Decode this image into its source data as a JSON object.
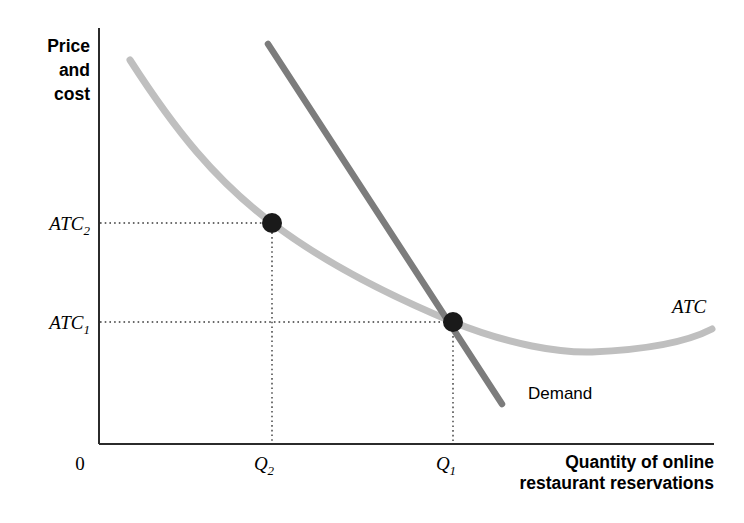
{
  "chart_data": {
    "type": "line",
    "title": "",
    "subtitle": "",
    "ylabel_lines": [
      "Price",
      "and",
      "cost"
    ],
    "xlabel_lines": [
      "Quantity of online",
      "restaurant reservations"
    ],
    "origin_label": "0",
    "grid": false,
    "legend_position": "inline-annotations",
    "axis": {
      "x_range_label": "Quantity of online restaurant reservations",
      "y_range_label": "Price and cost",
      "x_tick_labels": [
        "Q",
        "Q"
      ],
      "x_tick_label_full": [
        "Q2",
        "Q1"
      ],
      "y_tick_label_full": [
        "ATC2",
        "ATC1"
      ]
    },
    "y_ticks": [
      {
        "base": "ATC",
        "sub": "2",
        "value_note": "higher average total cost",
        "pixel_y": 223
      },
      {
        "base": "ATC",
        "sub": "1",
        "value_note": "lower average total cost",
        "pixel_y": 322
      }
    ],
    "x_ticks": [
      {
        "base": "Q",
        "sub": "2",
        "value_note": "smaller quantity",
        "pixel_x": 272
      },
      {
        "base": "Q",
        "sub": "1",
        "value_note": "larger quantity",
        "pixel_x": 453
      }
    ],
    "series": [
      {
        "name": "ATC",
        "label": "ATC",
        "type": "curve",
        "color": "#bfbfbf",
        "description": "U-shaped average total cost curve, downward sloping then rising",
        "path": "M 130 60 C 175 130, 215 180, 272 223 C 330 267, 400 300, 453 322 C 510 345, 560 353, 592 352 C 640 350, 685 343, 712 329",
        "label_x": 672,
        "label_y": 313
      },
      {
        "name": "Demand",
        "label": "Demand",
        "type": "line",
        "color": "#7c7c7c",
        "description": "Downward sloping demand curve crossing ATC at Q1",
        "path": "M 268 44 L 502 404",
        "label_x": 528,
        "label_y": 399
      }
    ],
    "points": [
      {
        "name": "point-q2",
        "x_label": "Q2",
        "y_label": "ATC2",
        "pixel_x": 272,
        "pixel_y": 223,
        "radius": 10,
        "color": "#1a1a1a",
        "note": "ATC at smaller quantity"
      },
      {
        "name": "point-q1",
        "x_label": "Q1",
        "y_label": "ATC1",
        "pixel_x": 453,
        "pixel_y": 322,
        "radius": 10,
        "color": "#1a1a1a",
        "note": "equilibrium where demand meets ATC"
      }
    ],
    "guides": [
      {
        "name": "guide-h-atc2",
        "type": "horizontal",
        "from": [
          100,
          223
        ],
        "to": [
          272,
          223
        ]
      },
      {
        "name": "guide-v-q2",
        "type": "vertical",
        "from": [
          272,
          223
        ],
        "to": [
          272,
          444
        ]
      },
      {
        "name": "guide-h-atc1",
        "type": "horizontal",
        "from": [
          100,
          322
        ],
        "to": [
          453,
          322
        ]
      },
      {
        "name": "guide-v-q1",
        "type": "vertical",
        "from": [
          453,
          322
        ],
        "to": [
          453,
          444
        ]
      }
    ],
    "colors": {
      "atc_curve": "#bfbfbf",
      "demand_line": "#7c7c7c",
      "axis": "#2b2b2b",
      "marker": "#1a1a1a",
      "guide": "#3a3a3a",
      "background": "#ffffff"
    }
  },
  "labels": {
    "y_axis_line1": "Price",
    "y_axis_line2": "and",
    "y_axis_line3": "cost",
    "x_axis_line1": "Quantity of online",
    "x_axis_line2": "restaurant reservations",
    "origin": "0",
    "atc2_base": "ATC",
    "atc2_sub": "2",
    "atc1_base": "ATC",
    "atc1_sub": "1",
    "q2_base": "Q",
    "q2_sub": "2",
    "q1_base": "Q",
    "q1_sub": "1",
    "atc_curve": "ATC",
    "demand_curve": "Demand"
  }
}
